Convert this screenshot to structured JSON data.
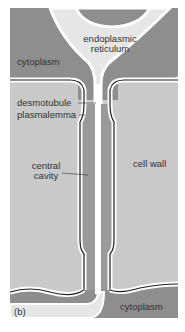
{
  "figure": {
    "panel_label": "(b)",
    "colors": {
      "cytoplasm": "#8e8e8e",
      "cell_wall": "#c9c9c9",
      "er": "#e6e6e6",
      "membrane": "#1e1e1e",
      "central_cavity": "#9a9a9a"
    }
  },
  "labels": {
    "er_line1": "endoplasmic",
    "er_line2": "reticulum",
    "cytoplasm_top": "cytoplasm",
    "desmotubule": "desmotubule",
    "plasmalemma": "plasmalemma",
    "central_line1": "central",
    "central_line2": "cavity",
    "cell_wall": "cell wall",
    "cytoplasm_bottom": "cytoplasm"
  }
}
